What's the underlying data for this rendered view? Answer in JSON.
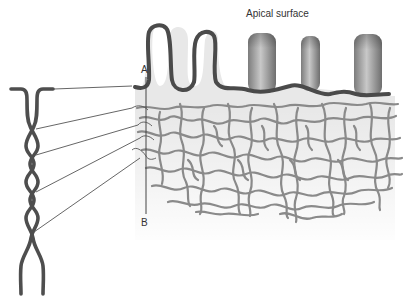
{
  "diagram": {
    "title": "Apical surface",
    "markers": {
      "a": "A",
      "b": "B"
    },
    "components": [
      {
        "id": "plasma-membrane",
        "desc": "dark folded membrane line with fingerlike projections"
      },
      {
        "id": "microvilli",
        "desc": "three shaded cylindrical projections on the apical surface",
        "count": 3
      },
      {
        "id": "glycocalyx-meshwork",
        "desc": "tangled grey filament network beneath membrane"
      },
      {
        "id": "twisted-strand",
        "desc": "magnified twisted double filament at left"
      },
      {
        "id": "leader-lines",
        "desc": "thin lines connecting strand to meshwork",
        "count": 5
      },
      {
        "id": "section-line",
        "desc": "vertical line from A to B"
      }
    ],
    "colors": {
      "membrane": "#4a4a4a",
      "filament": "#8a8a8a",
      "cytoplasm": "#e6e6e6",
      "microvillus": "#9a9a9a",
      "leader": "#555555"
    }
  }
}
